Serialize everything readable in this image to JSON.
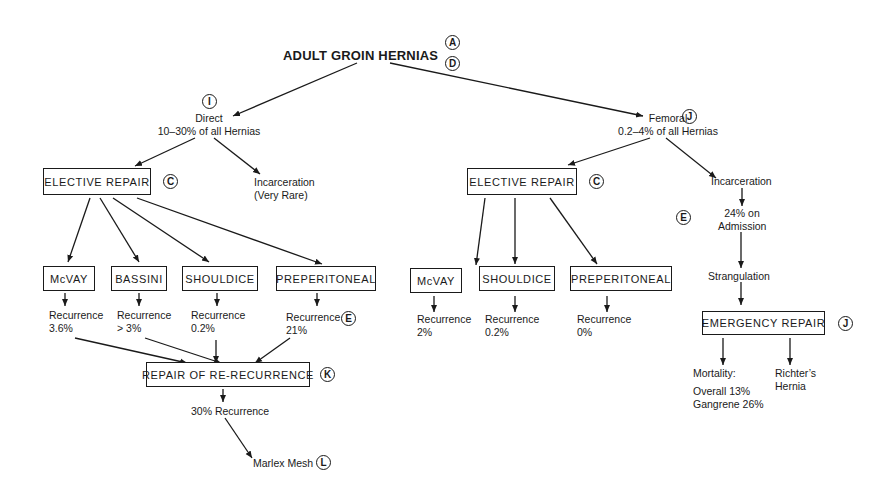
{
  "title": "ADULT GROIN HERNIAS",
  "title_refs": [
    "A",
    "D"
  ],
  "direct": {
    "ref": "I",
    "name": "Direct",
    "incidence": "10–30% of all Hernias",
    "incarceration": [
      "Incarceration",
      "(Very Rare)"
    ],
    "elective": {
      "label": "ELECTIVE REPAIR",
      "ref": "C"
    },
    "repairs": [
      {
        "label": "McVAY",
        "recurrence_label": "Recurrence",
        "recurrence": "3.6%"
      },
      {
        "label": "BASSINI",
        "recurrence_label": "Recurrence",
        "recurrence": "> 3%"
      },
      {
        "label": "SHOULDICE",
        "recurrence_label": "Recurrence",
        "recurrence": "0.2%"
      },
      {
        "label": "PREPERITONEAL",
        "recurrence_label": "Recurrence",
        "recurrence": "21%",
        "ref": "E"
      }
    ],
    "rerecurrence": {
      "label": "REPAIR OF RE-RECURRENCE",
      "ref": "K",
      "outcome": "30% Recurrence",
      "mesh": "Marlex Mesh",
      "mesh_ref": "L"
    }
  },
  "femoral": {
    "ref": "J",
    "name": "Femoral",
    "incidence": "0.2–4% of all Hernias",
    "elective": {
      "label": "ELECTIVE REPAIR",
      "ref": "C"
    },
    "repairs": [
      {
        "label": "McVAY",
        "recurrence_label": "Recurrence",
        "recurrence": "2%"
      },
      {
        "label": "SHOULDICE",
        "recurrence_label": "Recurrence",
        "recurrence": "0.2%"
      },
      {
        "label": "PREPERITONEAL",
        "recurrence_label": "Recurrence",
        "recurrence": "0%"
      }
    ],
    "incarceration": {
      "label": "Incarceration",
      "ref": "E",
      "admission": [
        "24% on",
        "Admission"
      ],
      "strangulation": "Strangulation"
    },
    "emergency": {
      "label": "EMERGENCY REPAIR",
      "ref": "J",
      "mortality_label": "Mortality:",
      "overall": "Overall 13%",
      "gangrene": "Gangrene 26%",
      "richter": [
        "Richter’s",
        "Hernia"
      ]
    }
  }
}
